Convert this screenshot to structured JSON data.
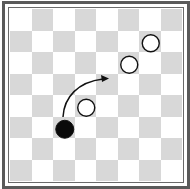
{
  "board": {
    "size": 8,
    "colors": {
      "dark_square": "#d8d8d8",
      "light_square": "#ffffff",
      "frame": "#5a5a5a"
    },
    "pieces": [
      {
        "color": "black",
        "row": 5,
        "col": 2
      },
      {
        "color": "white",
        "row": 4,
        "col": 3
      },
      {
        "color": "white",
        "row": 2,
        "col": 5
      },
      {
        "color": "white",
        "row": 1,
        "col": 6
      }
    ],
    "move_arrow": {
      "from": {
        "row": 5,
        "col": 2
      },
      "to": {
        "row": 3,
        "col": 4
      },
      "shape": "curved"
    }
  }
}
